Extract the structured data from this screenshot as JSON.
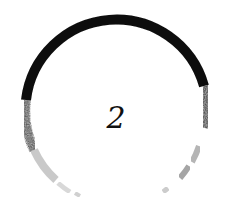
{
  "countdown": {
    "number": "2"
  },
  "colors": {
    "background": "#ffffff",
    "stroke": "#0d0d0d",
    "text": "#111111"
  }
}
